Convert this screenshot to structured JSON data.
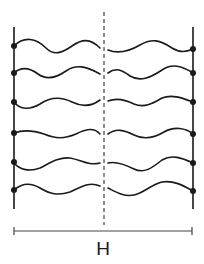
{
  "diagram": {
    "colors": {
      "stroke": "#1a1a1a",
      "background": "#ffffff"
    },
    "walls": {
      "left": {
        "x": 14,
        "y_top": 27,
        "y_bottom": 209
      },
      "right": {
        "x": 193,
        "y_top": 27,
        "y_bottom": 209
      }
    },
    "midplane": {
      "x": 104,
      "y_top": 12,
      "y_bottom": 225,
      "style": "dashed"
    },
    "chains": [
      {
        "row": 1,
        "y": 46
      },
      {
        "row": 2,
        "y": 73
      },
      {
        "row": 3,
        "y": 102
      },
      {
        "row": 4,
        "y": 133
      },
      {
        "row": 5,
        "y": 162
      },
      {
        "row": 6,
        "y": 190
      }
    ],
    "scale_bar": {
      "x_start": 14,
      "x_end": 192,
      "y": 231,
      "label": "H"
    }
  }
}
